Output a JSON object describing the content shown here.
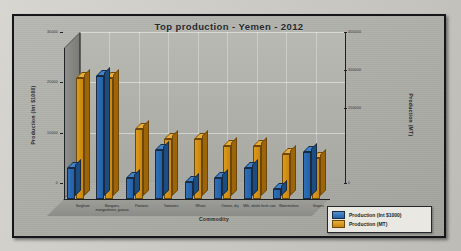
{
  "chart_data": {
    "type": "bar",
    "title": "Top production - Yemen - 2012",
    "xlabel": "Commodity",
    "ylabel": "Production (Int $1000)",
    "ylabel_right": "Production (MT)",
    "grid": true,
    "legend_position": "bottom-right",
    "ylim": [
      0,
      30000
    ],
    "ylim_right": [
      0,
      400000
    ],
    "yticks": [
      "30000",
      "20000",
      "10000",
      "0"
    ],
    "yticks_right": [
      "400000",
      "300000",
      "200000",
      "0"
    ],
    "categories": [
      "Sorghum",
      "Mangoes, mangosteens, guavas",
      "Potatoes",
      "Tomatoes",
      "Wheat",
      "Onions, dry",
      "Milk, whole fresh cow",
      "Watermelons",
      "Grapes"
    ],
    "series": [
      {
        "name": "Production (Int $1000)",
        "color": "#2462a6",
        "axis": "left",
        "values": [
          6100,
          24500,
          4200,
          9800,
          3400,
          4100,
          6200,
          1900,
          9300
        ]
      },
      {
        "name": "Production (MT)",
        "color": "#c8860f",
        "axis": "right",
        "values": [
          320000,
          320000,
          185000,
          160000,
          158000,
          140000,
          140000,
          120000,
          108000
        ]
      }
    ]
  },
  "legend": {
    "items": [
      {
        "label": "Production (Int $1000)",
        "color": "#2462a6"
      },
      {
        "label": "Production (MT)",
        "color": "#c8860f"
      }
    ]
  }
}
